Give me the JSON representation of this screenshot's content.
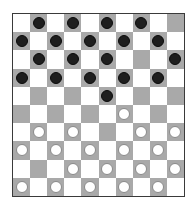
{
  "board": {
    "size": 10,
    "colors": {
      "light_square": "#ffffff",
      "dark_square": "#a9a9a9",
      "black_piece": "#1e1e1e",
      "white_piece": "#ffffff",
      "border": "#3a3a3a"
    },
    "rows": [
      ". b . b . b . b . .",
      "b . b . b . b . b .",
      ". b . b . b . . . b",
      "b . b . b . b . b .",
      ". . . . . b . . . .",
      ". . . . . . w . . .",
      ". w . w . . . w . w",
      "w . w . w . w . w .",
      ". . . w . w . w . w",
      "w . w . w . w . w ."
    ],
    "piece_counts": {
      "black": 20,
      "white": 20
    }
  }
}
